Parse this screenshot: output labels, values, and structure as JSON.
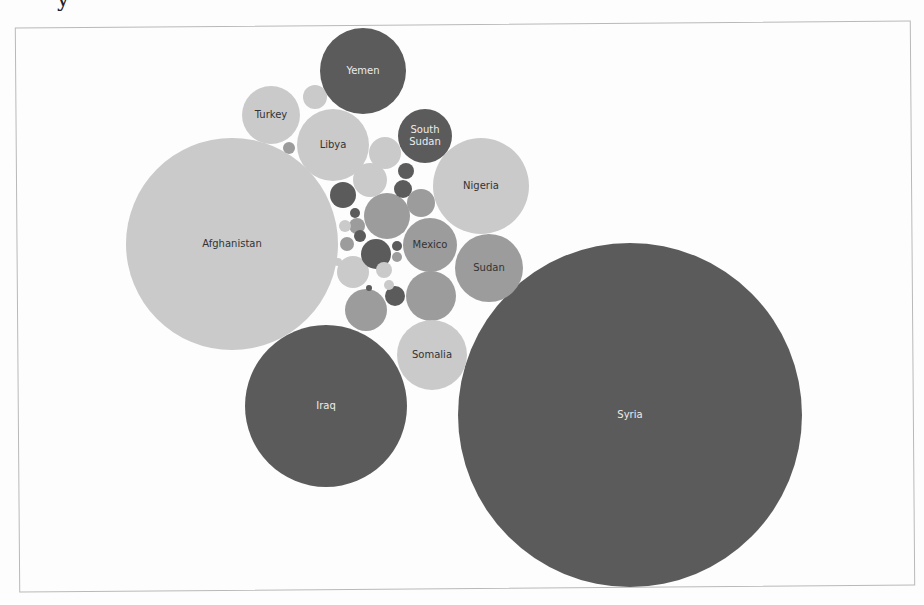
{
  "header": {
    "cut_title_fragment": "y"
  },
  "palette": {
    "dark": "#5b5b5b",
    "medium": "#9c9c9c",
    "light": "#cacaca",
    "label_on_dark": "#ececec",
    "label_on_light": "#333333",
    "frame": "#b9b9b9",
    "background": "#fdfdfd"
  },
  "chart_data": {
    "type": "bubble",
    "title": "",
    "xlabel": "",
    "ylabel": "",
    "grid": false,
    "legend": "none",
    "note": "Packed bubble chart; bubble area encodes magnitude. No numeric values are printed; radii are relative sizes measured in pixels.",
    "labeled_bubbles": [
      {
        "label": "Syria",
        "cx": 630,
        "cy": 415,
        "r": 172,
        "tone": "dark"
      },
      {
        "label": "Afghanistan",
        "cx": 232,
        "cy": 244,
        "r": 106,
        "tone": "light"
      },
      {
        "label": "Iraq",
        "cx": 326,
        "cy": 406,
        "r": 81,
        "tone": "dark"
      },
      {
        "label": "Nigeria",
        "cx": 481,
        "cy": 186,
        "r": 48,
        "tone": "light"
      },
      {
        "label": "Yemen",
        "cx": 363,
        "cy": 71,
        "r": 43,
        "tone": "dark"
      },
      {
        "label": "Libya",
        "cx": 333,
        "cy": 145,
        "r": 36,
        "tone": "light"
      },
      {
        "label": "Somalia",
        "cx": 432,
        "cy": 355,
        "r": 35,
        "tone": "light"
      },
      {
        "label": "Sudan",
        "cx": 489,
        "cy": 268,
        "r": 34,
        "tone": "medium"
      },
      {
        "label": "Turkey",
        "cx": 271,
        "cy": 115,
        "r": 29,
        "tone": "light"
      },
      {
        "label": "Mexico",
        "cx": 430,
        "cy": 245,
        "r": 27,
        "tone": "medium"
      },
      {
        "label": "South Sudan",
        "label_lines": [
          "South",
          "Sudan"
        ],
        "cx": 425,
        "cy": 136,
        "r": 27,
        "tone": "dark"
      }
    ],
    "unlabeled_bubbles": [
      {
        "cx": 431,
        "cy": 296,
        "r": 25,
        "tone": "medium"
      },
      {
        "cx": 387,
        "cy": 216,
        "r": 23,
        "tone": "medium"
      },
      {
        "cx": 366,
        "cy": 310,
        "r": 21,
        "tone": "medium"
      },
      {
        "cx": 370,
        "cy": 180,
        "r": 17,
        "tone": "light"
      },
      {
        "cx": 385,
        "cy": 153,
        "r": 16,
        "tone": "light"
      },
      {
        "cx": 353,
        "cy": 272,
        "r": 16,
        "tone": "light"
      },
      {
        "cx": 376,
        "cy": 254,
        "r": 15,
        "tone": "dark"
      },
      {
        "cx": 421,
        "cy": 203,
        "r": 14,
        "tone": "medium"
      },
      {
        "cx": 343,
        "cy": 195,
        "r": 13,
        "tone": "dark"
      },
      {
        "cx": 315,
        "cy": 97,
        "r": 12,
        "tone": "light"
      },
      {
        "cx": 395,
        "cy": 296,
        "r": 10,
        "tone": "dark"
      },
      {
        "cx": 403,
        "cy": 189,
        "r": 9,
        "tone": "dark"
      },
      {
        "cx": 406,
        "cy": 171,
        "r": 8,
        "tone": "dark"
      },
      {
        "cx": 357,
        "cy": 226,
        "r": 8,
        "tone": "medium"
      },
      {
        "cx": 384,
        "cy": 270,
        "r": 8,
        "tone": "light"
      },
      {
        "cx": 347,
        "cy": 244,
        "r": 7,
        "tone": "medium"
      },
      {
        "cx": 289,
        "cy": 148,
        "r": 6,
        "tone": "medium"
      },
      {
        "cx": 345,
        "cy": 226,
        "r": 6,
        "tone": "light"
      },
      {
        "cx": 360,
        "cy": 236,
        "r": 6,
        "tone": "dark"
      },
      {
        "cx": 355,
        "cy": 213,
        "r": 5,
        "tone": "dark"
      },
      {
        "cx": 397,
        "cy": 246,
        "r": 5,
        "tone": "dark"
      },
      {
        "cx": 397,
        "cy": 257,
        "r": 5,
        "tone": "medium"
      },
      {
        "cx": 338,
        "cy": 262,
        "r": 4,
        "tone": "light"
      },
      {
        "cx": 369,
        "cy": 288,
        "r": 3,
        "tone": "dark"
      },
      {
        "cx": 389,
        "cy": 285,
        "r": 5,
        "tone": "light"
      },
      {
        "cx": 401,
        "cy": 229,
        "r": 4,
        "tone": "medium"
      }
    ]
  }
}
